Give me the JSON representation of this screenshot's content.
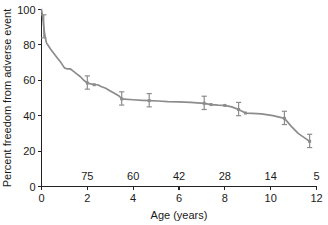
{
  "chart_data": {
    "type": "line",
    "title": "",
    "xlabel": "Age (years)",
    "ylabel": "Percent freedom from adverse event",
    "xlim": [
      0,
      12
    ],
    "ylim": [
      0,
      100
    ],
    "xticks": [
      0,
      2,
      4,
      6,
      8,
      10,
      12
    ],
    "xticklabels": [
      "0",
      "2",
      "4",
      "6",
      "8",
      "10",
      "12"
    ],
    "yticks": [
      0,
      20,
      40,
      60,
      80,
      100
    ],
    "yticklabels": [
      "0",
      "20",
      "40",
      "60",
      "80",
      "100"
    ],
    "grid": false,
    "legend": null,
    "line_color": "#8c8c8c",
    "errorbar_color": "#8c8c8c",
    "axis_color": "#222222",
    "series": [
      {
        "name": "Freedom from adverse event",
        "x": [
          0.0,
          0.05,
          0.1,
          0.15,
          0.22,
          0.3,
          0.4,
          0.55,
          0.7,
          0.85,
          1.0,
          1.1,
          1.25,
          1.4,
          1.55,
          1.7,
          1.85,
          2.0,
          2.15,
          2.3,
          2.45,
          2.6,
          2.8,
          3.0,
          3.2,
          3.4,
          3.5,
          3.6,
          4.0,
          4.4,
          4.7,
          5.1,
          5.5,
          6.0,
          6.5,
          7.1,
          7.4,
          7.7,
          8.0,
          8.3,
          8.6,
          8.9,
          9.2,
          9.6,
          10.1,
          10.6,
          10.9,
          11.2,
          11.7
        ],
        "y": [
          100.0,
          96.0,
          90.0,
          85.0,
          81.0,
          79.5,
          77.5,
          75.0,
          72.5,
          70.0,
          67.0,
          66.5,
          66.5,
          65.0,
          63.5,
          62.0,
          60.0,
          58.5,
          58.0,
          57.5,
          57.5,
          56.5,
          55.5,
          54.0,
          52.5,
          51.0,
          49.5,
          49.4,
          49.0,
          48.7,
          48.5,
          48.3,
          48.0,
          47.8,
          47.5,
          47.0,
          46.3,
          46.0,
          45.8,
          45.0,
          43.5,
          41.5,
          41.3,
          41.0,
          40.0,
          38.5,
          34.0,
          30.0,
          25.5
        ]
      }
    ],
    "error_bars": [
      {
        "x": 0.1,
        "y": 90.0,
        "lower": 84.0,
        "upper": 97.0
      },
      {
        "x": 2.0,
        "y": 58.5,
        "lower": 55.0,
        "upper": 62.5
      },
      {
        "x": 3.5,
        "y": 49.5,
        "lower": 46.0,
        "upper": 53.5
      },
      {
        "x": 4.7,
        "y": 48.5,
        "lower": 45.0,
        "upper": 52.5
      },
      {
        "x": 7.1,
        "y": 47.0,
        "lower": 43.5,
        "upper": 51.0
      },
      {
        "x": 8.6,
        "y": 43.5,
        "lower": 40.0,
        "upper": 47.5
      },
      {
        "x": 10.6,
        "y": 38.5,
        "lower": 35.0,
        "upper": 42.5
      },
      {
        "x": 11.7,
        "y": 25.5,
        "lower": 22.0,
        "upper": 29.5
      }
    ],
    "markers": [
      {
        "x": 2.0,
        "y": 58.5
      },
      {
        "x": 2.3,
        "y": 57.5
      },
      {
        "x": 3.5,
        "y": 49.5
      },
      {
        "x": 4.7,
        "y": 48.5
      },
      {
        "x": 7.1,
        "y": 47.0
      },
      {
        "x": 7.4,
        "y": 46.3
      },
      {
        "x": 8.0,
        "y": 45.8
      },
      {
        "x": 8.6,
        "y": 43.5
      },
      {
        "x": 8.9,
        "y": 41.5
      },
      {
        "x": 10.6,
        "y": 38.5
      },
      {
        "x": 11.7,
        "y": 25.5
      }
    ],
    "at_risk": {
      "label": "",
      "x": [
        2,
        4,
        6,
        8,
        10,
        12
      ],
      "counts": [
        "75",
        "60",
        "42",
        "28",
        "14",
        "5"
      ]
    }
  }
}
